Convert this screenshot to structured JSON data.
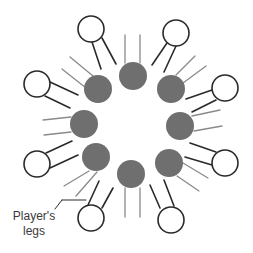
{
  "diagram": {
    "colors": {
      "background": "#ffffff",
      "inner_fill": "#6f6f6f",
      "inner_leg_stroke": "#8a8a8a",
      "outer_stroke": "#2a2a2a",
      "outer_leg_stroke": "#2a2a2a",
      "label_text": "#3a3a3a"
    },
    "inner_players": [
      {
        "cx": 133,
        "cy": 76,
        "r": 14,
        "legs": [
          [
            125,
            35,
            125,
            63
          ],
          [
            140,
            35,
            140,
            63
          ]
        ]
      },
      {
        "cx": 98,
        "cy": 89,
        "r": 14,
        "legs": [
          [
            70,
            57,
            93,
            76
          ],
          [
            62,
            69,
            86,
            88
          ]
        ]
      },
      {
        "cx": 84,
        "cy": 124,
        "r": 14,
        "legs": [
          [
            43,
            120,
            71,
            117
          ],
          [
            44,
            135,
            71,
            132
          ]
        ]
      },
      {
        "cx": 96,
        "cy": 157,
        "r": 14,
        "legs": [
          [
            89,
            171,
            64,
            186
          ],
          [
            97,
            172,
            76,
            196
          ]
        ]
      },
      {
        "cx": 131,
        "cy": 174,
        "r": 14,
        "legs": [
          [
            125,
            188,
            125,
            217
          ],
          [
            140,
            188,
            140,
            217
          ]
        ]
      },
      {
        "cx": 169,
        "cy": 163,
        "r": 14,
        "legs": [
          [
            183,
            163,
            208,
            178
          ],
          [
            177,
            176,
            199,
            191
          ]
        ]
      },
      {
        "cx": 180,
        "cy": 126,
        "r": 14,
        "legs": [
          [
            192,
            116,
            220,
            110
          ],
          [
            194,
            131,
            222,
            126
          ]
        ]
      },
      {
        "cx": 171,
        "cy": 89,
        "r": 14,
        "legs": [
          [
            176,
            75,
            195,
            56
          ],
          [
            183,
            83,
            206,
            66
          ]
        ]
      }
    ],
    "outer_players": [
      {
        "cx": 91,
        "cy": 29,
        "r": 13,
        "legs": [
          [
            92,
            42,
            101,
            69
          ],
          [
            102,
            38,
            116,
            64
          ]
        ]
      },
      {
        "cx": 176,
        "cy": 33,
        "r": 13,
        "legs": [
          [
            167,
            43,
            152,
            65
          ],
          [
            176,
            46,
            164,
            72
          ]
        ]
      },
      {
        "cx": 225,
        "cy": 88,
        "r": 13,
        "legs": [
          [
            212,
            90,
            186,
            99
          ],
          [
            216,
            100,
            192,
            112
          ]
        ]
      },
      {
        "cx": 225,
        "cy": 163,
        "r": 13,
        "legs": [
          [
            216,
            152,
            190,
            143
          ],
          [
            212,
            165,
            185,
            157
          ]
        ]
      },
      {
        "cx": 171,
        "cy": 220,
        "r": 13,
        "legs": [
          [
            160,
            208,
            150,
            185
          ],
          [
            174,
            206,
            164,
            180
          ]
        ]
      },
      {
        "cx": 91,
        "cy": 218,
        "r": 13,
        "legs": [
          [
            88,
            205,
            99,
            181
          ],
          [
            102,
            208,
            113,
            188
          ]
        ]
      },
      {
        "cx": 37,
        "cy": 164,
        "r": 13,
        "legs": [
          [
            46,
            153,
            72,
            141
          ],
          [
            50,
            168,
            78,
            155
          ]
        ]
      },
      {
        "cx": 37,
        "cy": 84,
        "r": 13,
        "legs": [
          [
            50,
            82,
            78,
            95
          ],
          [
            45,
            96,
            70,
            108
          ]
        ]
      }
    ],
    "annotation": {
      "line1": "Player's",
      "line2": "legs",
      "leader": [
        [
          55,
          209,
          62,
          200
        ],
        [
          62,
          200,
          86,
          200
        ]
      ]
    }
  }
}
